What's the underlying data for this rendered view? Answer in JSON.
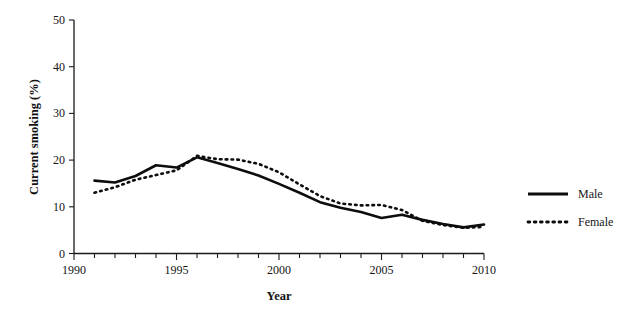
{
  "chart_data": {
    "type": "line",
    "title": "",
    "xlabel": "Year",
    "ylabel": "Current smoking (%)",
    "xlim": [
      1990,
      2010
    ],
    "ylim": [
      0,
      50
    ],
    "xticks": [
      1990,
      1991,
      1992,
      1993,
      1994,
      1995,
      1996,
      1997,
      1998,
      1999,
      2000,
      2001,
      2002,
      2003,
      2004,
      2005,
      2006,
      2007,
      2008,
      2009,
      2010
    ],
    "xtick_labels": [
      "1990",
      "",
      "",
      "",
      "",
      "1995",
      "",
      "",
      "",
      "",
      "2000",
      "",
      "",
      "",
      "",
      "2005",
      "",
      "",
      "",
      "",
      "2010"
    ],
    "yticks": [
      0,
      10,
      20,
      30,
      40,
      50
    ],
    "ytick_labels": [
      "0",
      "10",
      "20",
      "30",
      "40",
      "50"
    ],
    "grid": false,
    "legend_position": "right",
    "x": [
      1991,
      1992,
      1993,
      1994,
      1995,
      1996,
      1997,
      1998,
      1999,
      2000,
      2001,
      2002,
      2003,
      2004,
      2005,
      2006,
      2007,
      2008,
      2009,
      2010
    ],
    "series": [
      {
        "name": "Male",
        "style": "solid",
        "values": [
          15.6,
          15.2,
          16.6,
          18.9,
          18.4,
          20.6,
          19.4,
          18.1,
          16.7,
          14.9,
          13.0,
          11.0,
          9.8,
          8.9,
          7.6,
          8.3,
          7.2,
          6.3,
          5.6,
          6.2
        ]
      },
      {
        "name": "Female",
        "style": "dotted",
        "values": [
          13.0,
          14.2,
          15.8,
          16.8,
          17.8,
          20.9,
          20.2,
          20.1,
          19.2,
          17.4,
          14.8,
          12.3,
          10.7,
          10.3,
          10.4,
          9.3,
          7.0,
          6.1,
          5.5,
          5.7
        ]
      }
    ]
  },
  "legend": {
    "entries": [
      {
        "label": "Male"
      },
      {
        "label": "Female"
      }
    ]
  }
}
